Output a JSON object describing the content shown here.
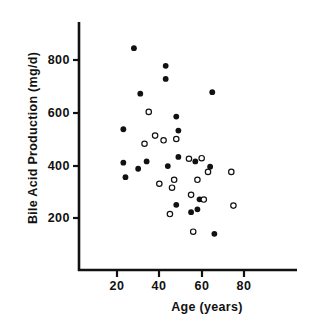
{
  "chart_data": {
    "type": "scatter",
    "title": "",
    "xlabel": "Age (years)",
    "ylabel": "Bile Acid Production (mg/d)",
    "xlim": [
      5,
      95
    ],
    "ylim": [
      0,
      900
    ],
    "xticks": [
      20,
      40,
      60,
      80
    ],
    "yticks": [
      200,
      400,
      600,
      800
    ],
    "grid": false,
    "legend": "none",
    "series": [
      {
        "name": "filled-circles",
        "marker": "filled-circle",
        "color": "#111111",
        "points": [
          {
            "x": 28,
            "y": 845
          },
          {
            "x": 43,
            "y": 778
          },
          {
            "x": 43,
            "y": 728
          },
          {
            "x": 31,
            "y": 672
          },
          {
            "x": 65,
            "y": 678
          },
          {
            "x": 48,
            "y": 585
          },
          {
            "x": 23,
            "y": 537
          },
          {
            "x": 49,
            "y": 532
          },
          {
            "x": 23,
            "y": 410
          },
          {
            "x": 34,
            "y": 415
          },
          {
            "x": 30,
            "y": 387
          },
          {
            "x": 24,
            "y": 355
          },
          {
            "x": 44,
            "y": 397
          },
          {
            "x": 49,
            "y": 432
          },
          {
            "x": 57,
            "y": 415
          },
          {
            "x": 64,
            "y": 395
          },
          {
            "x": 48,
            "y": 250
          },
          {
            "x": 55,
            "y": 222
          },
          {
            "x": 58,
            "y": 233
          },
          {
            "x": 59,
            "y": 271
          },
          {
            "x": 66,
            "y": 140
          }
        ]
      },
      {
        "name": "open-circles",
        "marker": "open-circle",
        "color": "#111111",
        "points": [
          {
            "x": 35,
            "y": 603
          },
          {
            "x": 38,
            "y": 513
          },
          {
            "x": 42,
            "y": 495
          },
          {
            "x": 33,
            "y": 482
          },
          {
            "x": 48,
            "y": 500
          },
          {
            "x": 54,
            "y": 425
          },
          {
            "x": 60,
            "y": 427
          },
          {
            "x": 63,
            "y": 375
          },
          {
            "x": 74,
            "y": 375
          },
          {
            "x": 47,
            "y": 345
          },
          {
            "x": 58,
            "y": 345
          },
          {
            "x": 40,
            "y": 330
          },
          {
            "x": 46,
            "y": 315
          },
          {
            "x": 55,
            "y": 288
          },
          {
            "x": 61,
            "y": 270
          },
          {
            "x": 75,
            "y": 247
          },
          {
            "x": 45,
            "y": 215
          },
          {
            "x": 56,
            "y": 148
          }
        ]
      }
    ]
  },
  "axes": {
    "x_tick_labels": [
      "20",
      "40",
      "60",
      "80"
    ],
    "y_tick_labels": [
      "800",
      "600",
      "400",
      "200"
    ]
  }
}
